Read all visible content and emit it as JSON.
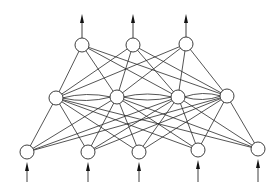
{
  "diagram": {
    "type": "neural-network",
    "colors": {
      "stroke": "#2a2a2a",
      "node_fill": "#ffffff",
      "background": "#ffffff"
    },
    "node_radius": 7,
    "layers": [
      {
        "name": "input",
        "nodes": [
          [
            27,
            152
          ],
          [
            88,
            152
          ],
          [
            139,
            152
          ],
          [
            198,
            150
          ],
          [
            258,
            149
          ]
        ],
        "arrow": "in-from-below"
      },
      {
        "name": "hidden",
        "nodes": [
          [
            56,
            98
          ],
          [
            117,
            97
          ],
          [
            178,
            97
          ],
          [
            227,
            96
          ]
        ],
        "lateral": "adjacent-pairs"
      },
      {
        "name": "output",
        "nodes": [
          [
            82,
            45
          ],
          [
            133,
            45
          ],
          [
            186,
            44
          ]
        ],
        "arrow": "out-upward"
      }
    ],
    "connections": [
      {
        "from": "input",
        "to": "hidden",
        "type": "fully-connected"
      },
      {
        "from": "hidden",
        "to": "output",
        "type": "fully-connected"
      },
      {
        "from": "hidden",
        "to": "hidden",
        "type": "lateral-adjacent-bidirectional-arcs"
      }
    ]
  }
}
